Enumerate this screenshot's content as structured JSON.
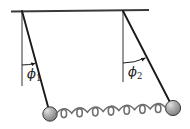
{
  "figure": {
    "background_color": "#ffffff",
    "line_color": "#1a1a1a",
    "ceiling_color": "#3a3a3a",
    "spring_color": "#6e6e6e",
    "bob_color": "#8d8d8d",
    "bob_highlight_color": "#d8d8d8",
    "bob_outline_color": "#3c3c3c"
  },
  "ceiling": {
    "label": "support-bar",
    "x1": 11,
    "y1": 11.5,
    "x2": 149,
    "y2": 10.0,
    "thickness": 2.2
  },
  "pendulums": [
    {
      "name": "left-pendulum",
      "pivot_x": 22,
      "pivot_y": 11,
      "bob_x": 50,
      "bob_y": 114,
      "bob_radius": 7.2,
      "reference_x": 22,
      "reference_y_end": 86,
      "angle_label": "ϕ",
      "angle_subscript": "1",
      "angle_label_x": 27,
      "angle_label_y": 78,
      "arc_radius": 54
    },
    {
      "name": "right-pendulum",
      "pivot_x": 123,
      "pivot_y": 11,
      "bob_x": 173,
      "bob_y": 108,
      "bob_radius": 7.6,
      "reference_x": 123,
      "reference_y_end": 82,
      "angle_label": "ϕ",
      "angle_subscript": "2",
      "angle_label_x": 128,
      "angle_label_y": 76,
      "arc_radius": 52
    }
  ],
  "spring": {
    "name": "coupling-spring",
    "start_x": 56,
    "start_y": 114,
    "end_x": 166,
    "end_y": 108,
    "coil_count": 7,
    "coil_radius": 4.1,
    "thickness": 1.6
  }
}
